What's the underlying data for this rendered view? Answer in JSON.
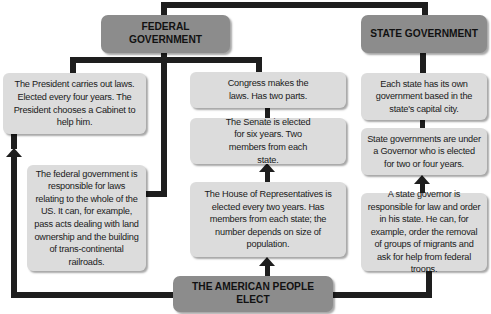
{
  "diagram": {
    "top_nodes": {
      "federal": "FEDERAL GOVERNMENT",
      "state": "STATE GOVERNMENT"
    },
    "federal_branch": {
      "president": "The President carries out laws. Elected every four years. The President chooses a Cabinet to help him.",
      "federal_responsibility": "The federal government is responsible for laws relating to the whole of the US. It can, for example, pass acts dealing with land ownership and the building of trans-continental railroads.",
      "congress": "Congress makes the laws. Has two parts.",
      "senate": "The Senate is elected for six years. Two members from each state.",
      "house": "The House of Representatives is elected every two years. Has members from each state; the number depends on size of population."
    },
    "state_branch": {
      "each_state": "Each state has its own government based in the state's capital city.",
      "governor": "State governments are under a Governor who is elected for two or four years.",
      "governor_responsibility": "A state governor is responsible for law and order in his state. He can, for example, order the removal of groups of migrants and ask for help from federal troops."
    },
    "bottom_node": "THE AMERICAN PEOPLE ELECT"
  },
  "colors": {
    "header_box": "#8c8c8c",
    "content_box": "#dcdcdc",
    "connector": "#1e1e1e",
    "background": "#ffffff"
  }
}
